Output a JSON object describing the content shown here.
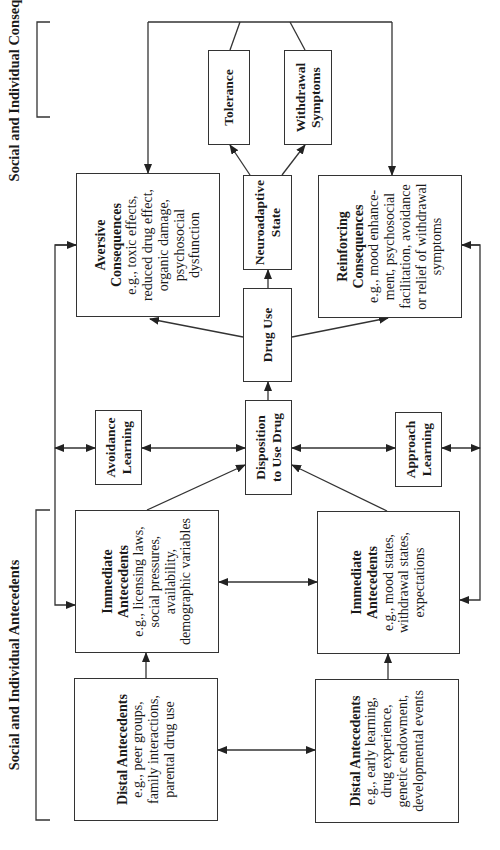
{
  "sections": {
    "consequences_label": "Social and Individual Consequences",
    "antecedents_label": "Social and Individual Antecedents"
  },
  "nodes": {
    "tolerance": {
      "title": "Tolerance"
    },
    "withdrawal": {
      "title": "Withdrawal Symptoms",
      "title_lines": [
        "Withdrawal",
        "Symptoms"
      ]
    },
    "neuroadaptive": {
      "title_lines": [
        "Neuroadaptive",
        "State"
      ]
    },
    "aversive": {
      "title_lines": [
        "Aversive",
        "Consequences"
      ],
      "desc_lines": [
        "e.g., toxic effects,",
        "reduced drug effect,",
        "organic damage,",
        "psychosocial",
        "dysfunction"
      ]
    },
    "reinforcing": {
      "title_lines": [
        "Reinforcing",
        "Consequences"
      ],
      "desc_lines": [
        "e.g., mood enhance-",
        "ment, psychosocial",
        "facilitation, avoidance",
        "or relief of withdrawal",
        "symptoms"
      ]
    },
    "drug_use": {
      "title": "Drug Use"
    },
    "disposition": {
      "title_lines": [
        "Disposition",
        "to Use Drug"
      ]
    },
    "avoidance_learning": {
      "title_lines": [
        "Avoidance",
        "Learning"
      ]
    },
    "approach_learning": {
      "title_lines": [
        "Approach",
        "Learning"
      ]
    },
    "immediate_social": {
      "title_lines": [
        "Immediate",
        "Antecedents"
      ],
      "desc_lines": [
        "e.g., licensing laws,",
        "social pressures,",
        "availability,",
        "demographic variables"
      ]
    },
    "immediate_individual": {
      "title_lines": [
        "Immediate",
        "Antecedents"
      ],
      "desc_lines": [
        "e.g., mood states,",
        "withdrawal states,",
        "expectations"
      ]
    },
    "distal_social": {
      "title": "Distal Antecedents",
      "desc_lines": [
        "e.g., peer groups,",
        "family interactions,",
        "parental drug use"
      ]
    },
    "distal_individual": {
      "title": "Distal Antecedents",
      "desc_lines": [
        "e.g., early learning,",
        "drug experience,",
        "genetic endowment,",
        "developmental events"
      ]
    }
  },
  "colors": {
    "line": "#333333",
    "background": "#ffffff",
    "text": "#1a1a1a"
  },
  "orientation": "rotated -90deg (text reads bottom-to-top)"
}
